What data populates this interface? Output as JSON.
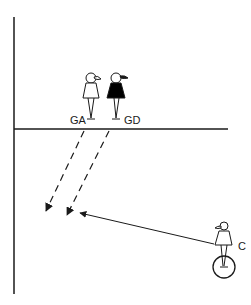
{
  "diagram": {
    "type": "netball-court-play",
    "colors": {
      "line": "#1a1a1a",
      "background": "#ffffff",
      "player_filled": "#000000",
      "player_outline": "#ffffff"
    },
    "players": [
      {
        "id": "GA",
        "label": "GA",
        "style": "outline"
      },
      {
        "id": "GD",
        "label": "GD",
        "style": "filled"
      },
      {
        "id": "C",
        "label": "C",
        "style": "outline",
        "marker": "circle-under"
      }
    ],
    "movements": [
      {
        "from": "GA",
        "type": "dashed-run",
        "direction": "down-left"
      },
      {
        "from": "GD",
        "type": "dashed-run",
        "direction": "down-left"
      },
      {
        "from": "C",
        "type": "pass",
        "direction": "left"
      }
    ]
  }
}
